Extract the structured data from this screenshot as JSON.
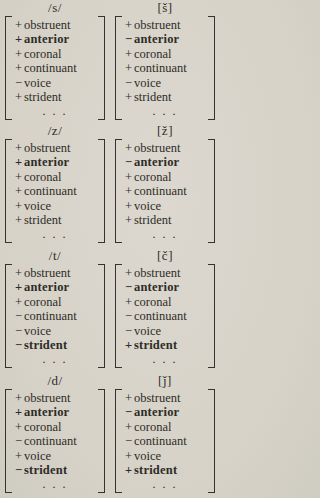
{
  "page": {
    "background_color": "#d8d4ca",
    "text_color": "#2e2c27",
    "description_ellipsis": ". . ."
  },
  "matrices": [
    {
      "label": "/s/",
      "ellipsis": ". . .",
      "features": [
        {
          "sign": "+",
          "name": "obstruent",
          "bold": false
        },
        {
          "sign": "+",
          "name": "anterior",
          "bold": true
        },
        {
          "sign": "+",
          "name": "coronal",
          "bold": false
        },
        {
          "sign": "+",
          "name": "continuant",
          "bold": false
        },
        {
          "sign": "−",
          "name": "voice",
          "bold": false
        },
        {
          "sign": "+",
          "name": "strident",
          "bold": false
        }
      ]
    },
    {
      "label": "[š]",
      "ellipsis": ". . .",
      "features": [
        {
          "sign": "+",
          "name": "obstruent",
          "bold": false
        },
        {
          "sign": "−",
          "name": "anterior",
          "bold": true
        },
        {
          "sign": "+",
          "name": "coronal",
          "bold": false
        },
        {
          "sign": "+",
          "name": "continuant",
          "bold": false
        },
        {
          "sign": "−",
          "name": "voice",
          "bold": false
        },
        {
          "sign": "+",
          "name": "strident",
          "bold": false
        }
      ]
    },
    {
      "label": "/z/",
      "ellipsis": ". . .",
      "features": [
        {
          "sign": "+",
          "name": "obstruent",
          "bold": false
        },
        {
          "sign": "+",
          "name": "anterior",
          "bold": true
        },
        {
          "sign": "+",
          "name": "coronal",
          "bold": false
        },
        {
          "sign": "+",
          "name": "continuant",
          "bold": false
        },
        {
          "sign": "+",
          "name": "voice",
          "bold": false
        },
        {
          "sign": "+",
          "name": "strident",
          "bold": false
        }
      ]
    },
    {
      "label": "[ž]",
      "ellipsis": ". . .",
      "features": [
        {
          "sign": "+",
          "name": "obstruent",
          "bold": false
        },
        {
          "sign": "−",
          "name": "anterior",
          "bold": true
        },
        {
          "sign": "+",
          "name": "coronal",
          "bold": false
        },
        {
          "sign": "+",
          "name": "continuant",
          "bold": false
        },
        {
          "sign": "+",
          "name": "voice",
          "bold": false
        },
        {
          "sign": "+",
          "name": "strident",
          "bold": false
        }
      ]
    },
    {
      "label": "/t/",
      "ellipsis": ". . .",
      "features": [
        {
          "sign": "+",
          "name": "obstruent",
          "bold": false
        },
        {
          "sign": "+",
          "name": "anterior",
          "bold": true
        },
        {
          "sign": "+",
          "name": "coronal",
          "bold": false
        },
        {
          "sign": "−",
          "name": "continuant",
          "bold": false
        },
        {
          "sign": "−",
          "name": "voice",
          "bold": false
        },
        {
          "sign": "−",
          "name": "strident",
          "bold": true
        }
      ]
    },
    {
      "label": "[č]",
      "ellipsis": ". . .",
      "features": [
        {
          "sign": "+",
          "name": "obstruent",
          "bold": false
        },
        {
          "sign": "−",
          "name": "anterior",
          "bold": true
        },
        {
          "sign": "+",
          "name": "coronal",
          "bold": false
        },
        {
          "sign": "−",
          "name": "continuant",
          "bold": false
        },
        {
          "sign": "−",
          "name": "voice",
          "bold": false
        },
        {
          "sign": "+",
          "name": "strident",
          "bold": true
        }
      ]
    },
    {
      "label": "/d/",
      "ellipsis": ". . .",
      "features": [
        {
          "sign": "+",
          "name": "obstruent",
          "bold": false
        },
        {
          "sign": "+",
          "name": "anterior",
          "bold": true
        },
        {
          "sign": "+",
          "name": "coronal",
          "bold": false
        },
        {
          "sign": "−",
          "name": "continuant",
          "bold": false
        },
        {
          "sign": "+",
          "name": "voice",
          "bold": false
        },
        {
          "sign": "−",
          "name": "strident",
          "bold": true
        }
      ]
    },
    {
      "label": "[ǰ]",
      "ellipsis": ". . .",
      "features": [
        {
          "sign": "+",
          "name": "obstruent",
          "bold": false
        },
        {
          "sign": "−",
          "name": "anterior",
          "bold": true
        },
        {
          "sign": "+",
          "name": "coronal",
          "bold": false
        },
        {
          "sign": "−",
          "name": "continuant",
          "bold": false
        },
        {
          "sign": "+",
          "name": "voice",
          "bold": false
        },
        {
          "sign": "+",
          "name": "strident",
          "bold": true
        }
      ]
    }
  ]
}
